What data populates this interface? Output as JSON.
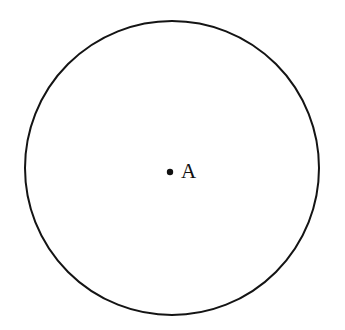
{
  "figure": {
    "type": "geometry-diagram",
    "background_color": "#ffffff",
    "canvas": {
      "width": 345,
      "height": 330
    },
    "circle": {
      "name": "circle-A",
      "center_x": 172,
      "center_y": 168,
      "radius_x": 147,
      "radius_y": 147,
      "stroke_color": "#141414",
      "stroke_width": 2,
      "fill": "none"
    },
    "center_point": {
      "name": "center-dot",
      "x": 170,
      "y": 172,
      "radius": 3.2,
      "fill_color": "#111111"
    },
    "center_point_label": {
      "text": "A",
      "x": 181,
      "y": 161,
      "font_size": 21,
      "color": "#111111"
    }
  }
}
